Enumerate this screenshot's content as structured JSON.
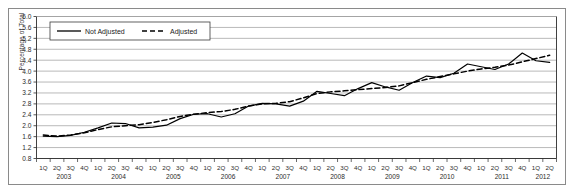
{
  "chart_data": {
    "type": "line",
    "title": "",
    "xlabel": "",
    "ylabel": "Percentage of Total",
    "ylim": [
      0.8,
      6.0
    ],
    "ytick_step": 0.4,
    "ytick_labels": [
      "0.8",
      "1.2",
      "1.6",
      "2.0",
      "2.4",
      "2.8",
      "3.2",
      "3.6",
      "4.0",
      "4.4",
      "4.8",
      "5.2",
      "5.6",
      "6.0"
    ],
    "grid": true,
    "legend_position": "top-left",
    "quarter_labels": [
      "1Q",
      "2Q",
      "3Q",
      "4Q"
    ],
    "years": [
      "2003",
      "2004",
      "2005",
      "2006",
      "2007",
      "2008",
      "2009",
      "2010",
      "2011",
      "2012"
    ],
    "x": [
      "1Q 2003",
      "2Q 2003",
      "3Q 2003",
      "4Q 2003",
      "1Q 2004",
      "2Q 2004",
      "3Q 2004",
      "4Q 2004",
      "1Q 2005",
      "2Q 2005",
      "3Q 2005",
      "4Q 2005",
      "1Q 2006",
      "2Q 2006",
      "3Q 2006",
      "4Q 2006",
      "1Q 2007",
      "2Q 2007",
      "3Q 2007",
      "4Q 2007",
      "1Q 2008",
      "2Q 2008",
      "3Q 2008",
      "4Q 2008",
      "1Q 2009",
      "2Q 2009",
      "3Q 2009",
      "4Q 2009",
      "1Q 2010",
      "2Q 2010",
      "3Q 2010",
      "4Q 2010",
      "1Q 2011",
      "2Q 2011",
      "3Q 2011",
      "4Q 2011",
      "1Q 2012",
      "2Q 2012"
    ],
    "series": [
      {
        "name": "Not Adjusted",
        "style": "solid",
        "color": "#000000",
        "values": [
          1.62,
          1.6,
          1.65,
          1.76,
          1.92,
          2.1,
          2.08,
          1.92,
          1.95,
          2.02,
          2.26,
          2.42,
          2.44,
          2.32,
          2.44,
          2.72,
          2.82,
          2.8,
          2.72,
          2.9,
          3.26,
          3.18,
          3.1,
          3.36,
          3.58,
          3.42,
          3.3,
          3.58,
          3.82,
          3.76,
          3.92,
          4.26,
          4.16,
          4.06,
          4.26,
          4.66,
          4.38,
          4.32
        ]
      },
      {
        "name": "Adjusted",
        "style": "dashed",
        "color": "#000000",
        "values": [
          1.66,
          1.62,
          1.66,
          1.74,
          1.86,
          1.96,
          2.0,
          2.04,
          2.12,
          2.22,
          2.34,
          2.42,
          2.48,
          2.52,
          2.6,
          2.72,
          2.8,
          2.82,
          2.88,
          3.02,
          3.18,
          3.24,
          3.28,
          3.32,
          3.36,
          3.4,
          3.46,
          3.58,
          3.7,
          3.8,
          3.9,
          4.0,
          4.08,
          4.14,
          4.22,
          4.34,
          4.46,
          4.58
        ]
      }
    ]
  },
  "legend": {
    "items": [
      {
        "label": "Not Adjusted",
        "style": "solid"
      },
      {
        "label": "Adjusted",
        "style": "dashed"
      }
    ]
  }
}
